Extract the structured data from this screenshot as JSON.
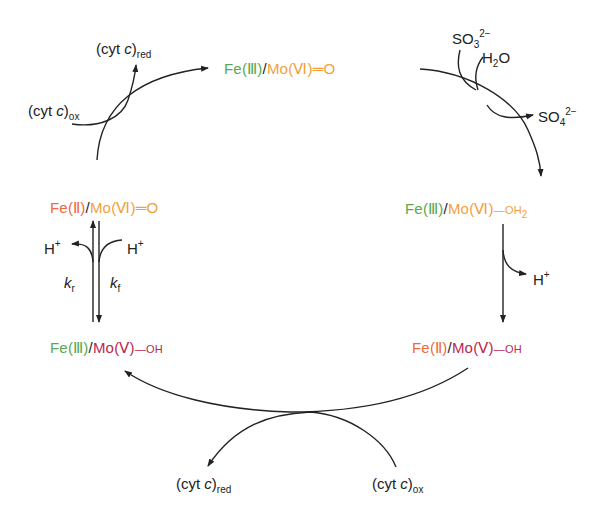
{
  "colors": {
    "fe_III": "#5aa84e",
    "fe_II": "#ee6a3c",
    "mo_VI": "#f3a03c",
    "mo_V": "#b8284f",
    "arrow": "#222222"
  },
  "states": {
    "top": {
      "fe": "Fe",
      "fe_ox": "(Ⅲ)",
      "slash": "/",
      "mo": "Mo",
      "mo_ox": "(Ⅵ)",
      "ligand": "═O"
    },
    "right_upper": {
      "fe": "Fe",
      "fe_ox": "(Ⅲ)",
      "slash": "/",
      "mo": "Mo",
      "mo_ox": "(Ⅵ)",
      "ligand": "—OH",
      "ligand_sub": "2"
    },
    "right_lower": {
      "fe": "Fe",
      "fe_ox": "(Ⅱ)",
      "slash": "/",
      "mo": "Mo",
      "mo_ox": "(Ⅴ)",
      "ligand": "—OH"
    },
    "left_lower": {
      "fe": "Fe",
      "fe_ox": "(Ⅲ)",
      "slash": "/",
      "mo": "Mo",
      "mo_ox": "(Ⅴ)",
      "ligand": "—OH"
    },
    "left_upper": {
      "fe": "Fe",
      "fe_ox": "(Ⅱ)",
      "slash": "/",
      "mo": "Mo",
      "mo_ox": "(Ⅵ)",
      "ligand": "═O"
    }
  },
  "reagents": {
    "so3": {
      "base": "SO",
      "sub": "3",
      "sup": "2−"
    },
    "h2o": {
      "a": "H",
      "sub": "2",
      "b": "O"
    },
    "so4": {
      "base": "SO",
      "sub": "4",
      "sup": "2−"
    },
    "h_plus_right": {
      "base": "H",
      "sup": "+"
    },
    "h_plus_left_out": {
      "base": "H",
      "sup": "+"
    },
    "h_plus_left_in": {
      "base": "H",
      "sup": "+"
    },
    "cyt_top_red": {
      "pre": "(cyt ",
      "c": "c",
      "post": ")",
      "sub": "red"
    },
    "cyt_top_ox": {
      "pre": "(cyt ",
      "c": "c",
      "post": ")",
      "sub": "ox"
    },
    "cyt_bottom_red": {
      "pre": "(cyt ",
      "c": "c",
      "post": ")",
      "sub": "red"
    },
    "cyt_bottom_ox": {
      "pre": "(cyt ",
      "c": "c",
      "post": ")",
      "sub": "ox"
    }
  },
  "rates": {
    "kr": {
      "k": "k",
      "sub": "r"
    },
    "kf": {
      "k": "k",
      "sub": "f"
    }
  }
}
